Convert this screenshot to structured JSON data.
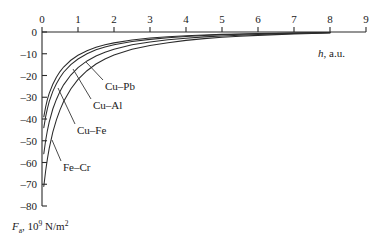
{
  "chart_data": {
    "type": "line",
    "title": "",
    "xlabel": "h, a.u.",
    "ylabel": "F_a, 10^9 N/m^2",
    "xlim": [
      0,
      9
    ],
    "ylim": [
      -80,
      0
    ],
    "grid": false,
    "legend": "inline-callouts",
    "x_axis_position": "top",
    "xticks": [
      "0",
      "1",
      "2",
      "3",
      "4",
      "5",
      "6",
      "7",
      "8",
      "9"
    ],
    "yticks": [
      "0",
      "-10",
      "-20",
      "-30",
      "-40",
      "-50",
      "-60",
      "-70",
      "-80"
    ],
    "x": [
      0.05,
      0.1,
      0.15,
      0.2,
      0.3,
      0.4,
      0.5,
      0.6,
      0.8,
      1.0,
      1.25,
      1.5,
      1.75,
      2.0,
      2.5,
      3.0,
      3.5,
      4.0,
      4.5,
      5.0,
      5.5,
      6.0,
      6.5,
      7.0,
      7.5,
      8.0
    ],
    "series": [
      {
        "name": "Cu-Pb",
        "label": "Cu–Pb",
        "values": [
          -39.0,
          -34.5,
          -31.0,
          -28.2,
          -24.0,
          -20.8,
          -18.2,
          -16.1,
          -13.0,
          -10.7,
          -8.6,
          -7.0,
          -5.9,
          -5.0,
          -3.7,
          -2.8,
          -2.2,
          -1.7,
          -1.35,
          -1.1,
          -0.9,
          -0.7,
          -0.55,
          -0.42,
          -0.3,
          -0.2
        ]
      },
      {
        "name": "Cu-Al",
        "label": "Cu–Al",
        "values": [
          -44.0,
          -39.0,
          -35.2,
          -32.0,
          -27.3,
          -23.8,
          -20.9,
          -18.5,
          -15.0,
          -12.4,
          -10.0,
          -8.2,
          -6.9,
          -5.9,
          -4.4,
          -3.4,
          -2.6,
          -2.05,
          -1.6,
          -1.3,
          -1.05,
          -0.85,
          -0.65,
          -0.5,
          -0.35,
          -0.22
        ]
      },
      {
        "name": "Cu-Fe",
        "label": "Cu–Fe",
        "values": [
          -56.0,
          -50.0,
          -45.3,
          -41.4,
          -35.4,
          -31.0,
          -27.3,
          -24.3,
          -19.8,
          -16.4,
          -13.3,
          -11.0,
          -9.3,
          -7.9,
          -5.9,
          -4.6,
          -3.6,
          -2.85,
          -2.25,
          -1.8,
          -1.45,
          -1.15,
          -0.9,
          -0.68,
          -0.48,
          -0.3
        ]
      },
      {
        "name": "Fe-Cr",
        "label": "Fe–Cr",
        "values": [
          -71.0,
          -64.0,
          -58.3,
          -53.5,
          -46.0,
          -40.4,
          -35.8,
          -32.0,
          -26.2,
          -21.8,
          -17.8,
          -14.7,
          -12.4,
          -10.6,
          -7.9,
          -6.2,
          -4.9,
          -3.85,
          -3.05,
          -2.45,
          -1.95,
          -1.55,
          -1.2,
          -0.92,
          -0.65,
          -0.4
        ]
      }
    ],
    "annotations": [
      {
        "text": "Cu–Pb",
        "x_px": 105,
        "y_px": 86
      },
      {
        "text": "Cu–Al",
        "x_px": 93,
        "y_px": 105
      },
      {
        "text": "Cu–Fe",
        "x_px": 77,
        "y_px": 130
      },
      {
        "text": "Fe–Cr",
        "x_px": 63,
        "y_px": 167
      }
    ]
  },
  "axes": {
    "x_label_main": "h",
    "x_label_units": ", a.u.",
    "y_label_main": "F",
    "y_label_sub": "a",
    "y_label_mid": ", 10",
    "y_label_sup": "9",
    "y_label_tail": " N/m",
    "y_label_tail_sup": "2"
  },
  "colors": {
    "curve": "#2b2b2b",
    "axis": "#2a2a2a",
    "text": "#1a1a1a",
    "background": "#ffffff"
  }
}
